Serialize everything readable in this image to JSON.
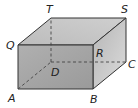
{
  "diagram": {
    "type": "rectangular prism",
    "vertices": {
      "A": {
        "label": "A",
        "x": 18,
        "y": 89
      },
      "B": {
        "label": "B",
        "x": 93,
        "y": 89
      },
      "C": {
        "label": "C",
        "x": 126,
        "y": 62
      },
      "D": {
        "label": "D",
        "x": 51,
        "y": 62
      },
      "Q": {
        "label": "Q",
        "x": 18,
        "y": 45
      },
      "R": {
        "label": "R",
        "x": 93,
        "y": 45
      },
      "S": {
        "label": "S",
        "x": 126,
        "y": 18
      },
      "T": {
        "label": "T",
        "x": 51,
        "y": 18
      }
    },
    "hidden_edges": [
      "AD",
      "DC",
      "DT"
    ],
    "colors": {
      "front_face": "#a6a6a6",
      "top_face": "#c4c4c4",
      "right_face": "#bdbdbd",
      "edge": "#333333"
    }
  }
}
